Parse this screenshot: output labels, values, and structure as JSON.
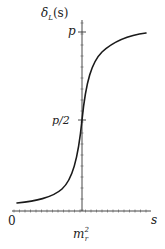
{
  "chart_data": {
    "type": "line",
    "title": "",
    "xlabel": "s",
    "ylabel": "δ_L(s)",
    "ylabel_main": "δ",
    "ylabel_sub": "L",
    "ylabel_arg": "(s)",
    "x_ticks": [
      {
        "label": "0",
        "position": "origin"
      },
      {
        "label": "m_r^2",
        "main": "m",
        "sub": "r",
        "sup": "2",
        "position": "center"
      }
    ],
    "y_ticks": [
      {
        "label": "p/2",
        "value": 0.5
      },
      {
        "label": "p",
        "value": 1.0
      }
    ],
    "series": [
      {
        "name": "delta_L(s)",
        "description": "sigmoid-like phase shift rising from near 0 to p, passing p/2 at s = m_r^2",
        "x": [
          0.03,
          0.2,
          0.35,
          0.45,
          0.5,
          0.55,
          0.65,
          0.8,
          0.97
        ],
        "y": [
          0.05,
          0.06,
          0.12,
          0.32,
          0.5,
          0.68,
          0.88,
          0.96,
          0.99
        ]
      }
    ],
    "xlim": [
      0,
      1
    ],
    "ylim": [
      0,
      1.1
    ],
    "grid": false,
    "legend": null
  },
  "labels": {
    "y_axis_main": "δ",
    "y_axis_sub": "L",
    "y_axis_arg": "(s)",
    "y_tick_top": "p",
    "y_tick_mid": "p/2",
    "x_origin": "0",
    "x_axis": "s",
    "x_center_main": "m",
    "x_center_sub": "r",
    "x_center_sup": "2"
  },
  "colors": {
    "axis": "#333333",
    "curve": "#1a1a1a",
    "background": "#ffffff"
  }
}
